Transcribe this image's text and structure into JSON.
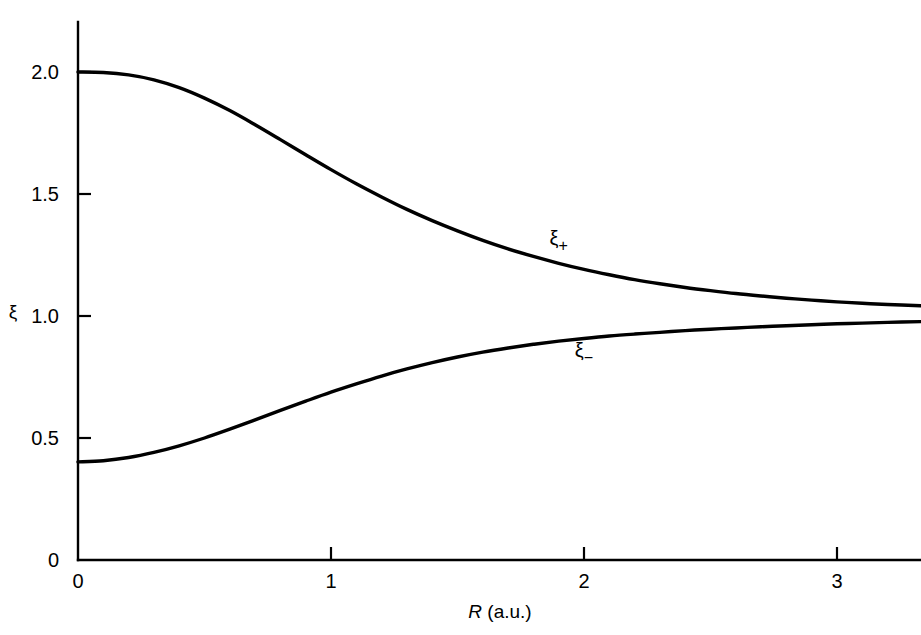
{
  "figure": {
    "background_color": "#ffffff",
    "line_color": "#000000"
  },
  "chart_data": {
    "type": "line",
    "title": "",
    "subtitle": "",
    "xlabel": "R (a.u.)",
    "xlabel_italic_part": "R",
    "xlabel_roman_part": " (a.u.)",
    "ylabel": "ξ",
    "xlim": [
      0,
      3.33
    ],
    "ylim": [
      0,
      2.1
    ],
    "xticks": [
      0,
      1,
      2,
      3
    ],
    "xticklabels": [
      "0",
      "1",
      "2",
      "3"
    ],
    "yticks": [
      0,
      0.5,
      1.0,
      1.5,
      2.0
    ],
    "yticklabels": [
      "0",
      "0.5",
      "1.0",
      "1.5",
      "2.0"
    ],
    "grid": false,
    "legend_position": "inline-annotations",
    "annotations": [
      {
        "text": "ξ",
        "subscript": "+",
        "x": 1.9,
        "y": 1.29
      },
      {
        "text": "ξ",
        "subscript": "−",
        "x": 2.0,
        "y": 0.83
      }
    ],
    "series": [
      {
        "name": "ξ+",
        "label": "ξ₊",
        "color": "#000000",
        "x": [
          0.0,
          0.1,
          0.2,
          0.3,
          0.4,
          0.5,
          0.6,
          0.7,
          0.8,
          0.9,
          1.0,
          1.1,
          1.2,
          1.3,
          1.4,
          1.5,
          1.6,
          1.7,
          1.8,
          1.9,
          2.0,
          2.1,
          2.2,
          2.3,
          2.4,
          2.5,
          2.6,
          2.7,
          2.8,
          2.9,
          3.0,
          3.1,
          3.2,
          3.33
        ],
        "y": [
          2.0,
          1.998,
          1.988,
          1.968,
          1.936,
          1.893,
          1.842,
          1.784,
          1.723,
          1.661,
          1.6,
          1.542,
          1.488,
          1.437,
          1.391,
          1.349,
          1.31,
          1.275,
          1.244,
          1.216,
          1.191,
          1.169,
          1.149,
          1.132,
          1.117,
          1.104,
          1.092,
          1.082,
          1.073,
          1.065,
          1.058,
          1.052,
          1.047,
          1.042
        ]
      },
      {
        "name": "ξ−",
        "label": "ξ₋",
        "color": "#000000",
        "x": [
          0.0,
          0.1,
          0.2,
          0.3,
          0.4,
          0.5,
          0.6,
          0.7,
          0.8,
          0.9,
          1.0,
          1.1,
          1.2,
          1.3,
          1.4,
          1.5,
          1.6,
          1.7,
          1.8,
          1.9,
          2.0,
          2.1,
          2.2,
          2.3,
          2.4,
          2.5,
          2.6,
          2.7,
          2.8,
          2.9,
          3.0,
          3.1,
          3.2,
          3.33
        ],
        "y": [
          0.402,
          0.407,
          0.42,
          0.441,
          0.468,
          0.5,
          0.536,
          0.574,
          0.613,
          0.651,
          0.688,
          0.722,
          0.754,
          0.783,
          0.809,
          0.832,
          0.852,
          0.869,
          0.884,
          0.897,
          0.908,
          0.918,
          0.926,
          0.933,
          0.94,
          0.946,
          0.951,
          0.956,
          0.96,
          0.964,
          0.968,
          0.971,
          0.974,
          0.977
        ]
      }
    ]
  }
}
